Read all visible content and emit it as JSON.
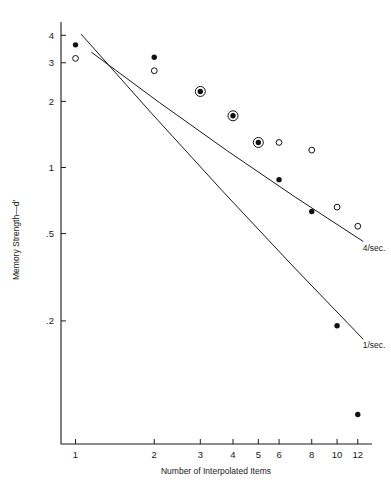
{
  "chart_data": {
    "type": "scatter",
    "title": "",
    "xlabel": "Number of Interpolated Items",
    "ylabel": "Memory Strength—d′",
    "xscale": "log",
    "yscale": "log",
    "xlim": [
      0.88,
      13.6
    ],
    "ylim": [
      0.055,
      4.6
    ],
    "grid": false,
    "legend_position": "inline-right",
    "xticks": [
      1,
      2,
      3,
      4,
      5,
      6,
      8,
      10,
      12
    ],
    "xtick_labels": [
      "1",
      "2",
      "3",
      "4",
      "5",
      "6",
      "8",
      "10",
      "12"
    ],
    "yticks": [
      4,
      3,
      2,
      1,
      0.5,
      0.2
    ],
    "ytick_labels": [
      "4",
      "3",
      "2",
      "1",
      ".5",
      ".2"
    ],
    "series": [
      {
        "name": "1/sec.",
        "marker": "filled-circle",
        "label": "1/sec.",
        "x": [
          1,
          2,
          3,
          4,
          5,
          6,
          8,
          10,
          12
        ],
        "y": [
          3.62,
          3.18,
          2.22,
          1.72,
          1.3,
          0.88,
          0.63,
          0.19,
          0.075
        ]
      },
      {
        "name": "4/sec.",
        "marker": "open-circle",
        "label": "4/sec.",
        "x": [
          1,
          2,
          3,
          4,
          5,
          6,
          8,
          10,
          12
        ],
        "y": [
          3.14,
          2.76,
          2.2,
          1.72,
          1.3,
          1.3,
          1.2,
          0.66,
          0.54
        ]
      }
    ],
    "circled_points": [
      {
        "x": 4,
        "y": 1.72,
        "note": "overlapping filled and open marker"
      },
      {
        "x": 5,
        "y": 1.3,
        "note": "overlapping filled and open marker"
      },
      {
        "x": 3,
        "y": 2.21,
        "note": "overlapping filled and open marker"
      }
    ],
    "fit_lines": [
      {
        "label": "4/sec.",
        "x_start": 1.15,
        "y_start": 3.35,
        "x_end": 12.6,
        "y_end": 0.46,
        "label_x": 12.1,
        "label_y": 0.43
      },
      {
        "label": "1/sec.",
        "x_start": 1.05,
        "y_start": 4.05,
        "x_end": 12.6,
        "y_end": 0.165,
        "label_x": 12.1,
        "label_y": 0.155
      }
    ],
    "annotations": [
      {
        "text": "4/sec.",
        "role": "upper-fit-line-label"
      },
      {
        "text": "1/sec.",
        "role": "lower-fit-line-label"
      }
    ]
  }
}
